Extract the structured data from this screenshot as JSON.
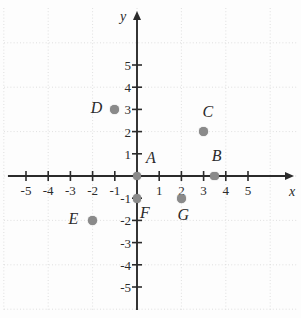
{
  "figure": {
    "kind": "cartesian-coordinate-plane",
    "axis_labels": {
      "x": "x",
      "y": "y"
    },
    "xlim": [
      -5.8,
      5.8
    ],
    "ylim": [
      -5.6,
      5.8
    ],
    "x_ticks": [
      "-5",
      "-4",
      "-3",
      "-2",
      "-1",
      "1",
      "2",
      "3",
      "4",
      "5"
    ],
    "y_ticks": [
      "5",
      "4",
      "3",
      "2",
      "1",
      "-1",
      "-2",
      "-3",
      "-4",
      "-5"
    ],
    "grid": "dotted-light-every-2-units",
    "colors": {
      "axis": "#2b2b2b",
      "point": "#8a8a8a",
      "grid": "#d8d8d8",
      "text": "#2a2a2a",
      "background": "#fdfdfd"
    }
  },
  "chart_data": {
    "type": "scatter",
    "title": "",
    "xlabel": "x",
    "ylabel": "y",
    "xlim": [
      -5.8,
      5.8
    ],
    "ylim": [
      -5.6,
      5.8
    ],
    "grid": true,
    "legend": "none",
    "points": [
      {
        "label": "A",
        "x": 0,
        "y": 0,
        "label_dx": 14,
        "label_dy": -18
      },
      {
        "label": "B",
        "x": 3.5,
        "y": 0,
        "label_dx": 2,
        "label_dy": -20
      },
      {
        "label": "C",
        "x": 3,
        "y": 2,
        "label_dx": 4,
        "label_dy": -20
      },
      {
        "label": "D",
        "x": -1,
        "y": 3,
        "label_dx": -19,
        "label_dy": -1
      },
      {
        "label": "E",
        "x": -2,
        "y": -2,
        "label_dx": -19,
        "label_dy": -1
      },
      {
        "label": "F",
        "x": 0,
        "y": -1,
        "label_dx": 8,
        "label_dy": 15
      },
      {
        "label": "G",
        "x": 2,
        "y": -1,
        "label_dx": 1,
        "label_dy": 17
      }
    ]
  }
}
